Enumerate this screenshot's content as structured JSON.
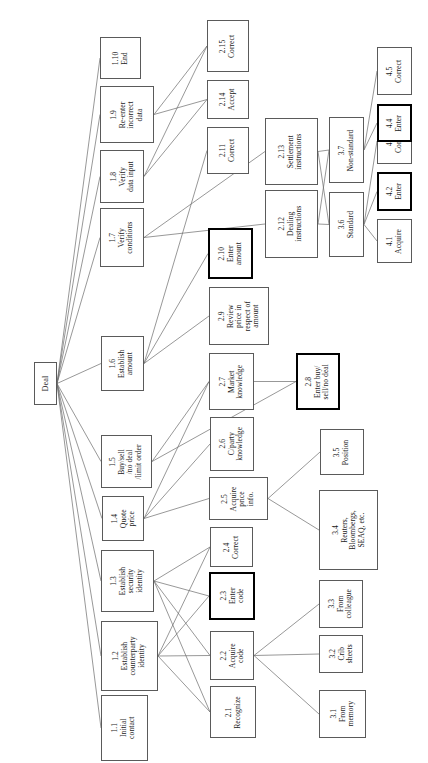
{
  "diagram": {
    "orientation": "rotated-90-ccw",
    "root": {
      "id": "deal",
      "num": "",
      "text": "Deal",
      "x": 34,
      "y": 362,
      "w": 23,
      "h": 43,
      "bold": false
    },
    "nodes": [
      {
        "id": "1.1",
        "num": "1.1",
        "text": "Initial\ncontact",
        "x": 101,
        "y": 695,
        "w": 47,
        "h": 66,
        "bold": false
      },
      {
        "id": "1.2",
        "num": "1.2",
        "text": "Establish\ncounterparty\nidentity",
        "x": 101,
        "y": 621,
        "w": 57,
        "h": 70,
        "bold": false
      },
      {
        "id": "1.3",
        "num": "1.3",
        "text": "Establish\nsecurity\nidentity",
        "x": 101,
        "y": 550,
        "w": 53,
        "h": 62,
        "bold": false
      },
      {
        "id": "1.4",
        "num": "1.4",
        "text": "Quote\nprice",
        "x": 102,
        "y": 496,
        "w": 42,
        "h": 45,
        "bold": false
      },
      {
        "id": "1.5",
        "num": "1.5",
        "text": "Buy/sell\n/no deal\n/limit order",
        "x": 101,
        "y": 435,
        "w": 51,
        "h": 53,
        "bold": false
      },
      {
        "id": "1.6",
        "num": "1.6",
        "text": "Establish\namount",
        "x": 101,
        "y": 336,
        "w": 43,
        "h": 55,
        "bold": false
      },
      {
        "id": "1.7",
        "num": "1.7",
        "text": "Verify\nconditions",
        "x": 100,
        "y": 208,
        "w": 44,
        "h": 59,
        "bold": false
      },
      {
        "id": "1.8",
        "num": "1.8",
        "text": "Verify\ndata input",
        "x": 100,
        "y": 150,
        "w": 44,
        "h": 53,
        "bold": false
      },
      {
        "id": "1.9",
        "num": "1.9",
        "text": "Re-enter\nincorrect\ndata",
        "x": 100,
        "y": 86,
        "w": 54,
        "h": 57,
        "bold": false
      },
      {
        "id": "1.10",
        "num": "1.10",
        "text": "End",
        "x": 100,
        "y": 37,
        "w": 41,
        "h": 42,
        "bold": false
      },
      {
        "id": "2.1",
        "num": "2.1",
        "text": "Recognize",
        "x": 210,
        "y": 686,
        "w": 46,
        "h": 52,
        "bold": false
      },
      {
        "id": "2.2",
        "num": "2.2",
        "text": "Acquire\ncode",
        "x": 210,
        "y": 631,
        "w": 44,
        "h": 49,
        "bold": false
      },
      {
        "id": "2.3",
        "num": "2.3",
        "text": "Enter\ncode",
        "x": 209,
        "y": 572,
        "w": 46,
        "h": 48,
        "bold": true
      },
      {
        "id": "2.4",
        "num": "2.4",
        "text": "Correct",
        "x": 210,
        "y": 527,
        "w": 43,
        "h": 40,
        "bold": false
      },
      {
        "id": "2.5",
        "num": "2.5",
        "text": "Acquire\nprice\ninfo.",
        "x": 209,
        "y": 477,
        "w": 59,
        "h": 43,
        "bold": false
      },
      {
        "id": "2.6",
        "num": "2.6",
        "text": "C/party\nknowledge",
        "x": 210,
        "y": 417,
        "w": 44,
        "h": 54,
        "bold": false
      },
      {
        "id": "2.7",
        "num": "2.7",
        "text": "Market\nknowledge",
        "x": 209,
        "y": 353,
        "w": 45,
        "h": 57,
        "bold": false
      },
      {
        "id": "2.8",
        "num": "2.8",
        "text": "Enter buy/\nsell/no deal",
        "x": 296,
        "y": 353,
        "w": 44,
        "h": 57,
        "bold": true
      },
      {
        "id": "2.9",
        "num": "2.9",
        "text": "Review\nprice in\nrespect of\namount",
        "x": 209,
        "y": 287,
        "w": 60,
        "h": 58,
        "bold": false
      },
      {
        "id": "2.10",
        "num": "2.10",
        "text": "Enter\namount",
        "x": 208,
        "y": 228,
        "w": 45,
        "h": 51,
        "bold": true
      },
      {
        "id": "2.11",
        "num": "2.11",
        "text": "Correct",
        "x": 207,
        "y": 127,
        "w": 42,
        "h": 47,
        "bold": false
      },
      {
        "id": "2.12",
        "num": "2.12",
        "text": "Dealing\ninstructions",
        "x": 265,
        "y": 190,
        "w": 53,
        "h": 68,
        "bold": false
      },
      {
        "id": "2.13",
        "num": "2.13",
        "text": "Settlement\ninstructions",
        "x": 265,
        "y": 118,
        "w": 53,
        "h": 67,
        "bold": false
      },
      {
        "id": "2.14",
        "num": "2.14",
        "text": "Accept",
        "x": 207,
        "y": 80,
        "w": 42,
        "h": 39,
        "bold": false
      },
      {
        "id": "2.15",
        "num": "2.15",
        "text": "Correct",
        "x": 207,
        "y": 20,
        "w": 42,
        "h": 52,
        "bold": false
      },
      {
        "id": "3.1",
        "num": "3.1",
        "text": "From\nmemory",
        "x": 319,
        "y": 690,
        "w": 47,
        "h": 48,
        "bold": false
      },
      {
        "id": "3.2",
        "num": "3.2",
        "text": "Crib\nsheets",
        "x": 319,
        "y": 635,
        "w": 44,
        "h": 38,
        "bold": false
      },
      {
        "id": "3.3",
        "num": "3.3",
        "text": "From\ncolleague",
        "x": 319,
        "y": 580,
        "w": 44,
        "h": 48,
        "bold": false
      },
      {
        "id": "3.4",
        "num": "3.4",
        "text": "Reuters,\nBloombergs,\nSEAQ, etc.",
        "x": 319,
        "y": 490,
        "w": 59,
        "h": 80,
        "bold": false
      },
      {
        "id": "3.5",
        "num": "3.5",
        "text": "Position",
        "x": 320,
        "y": 429,
        "w": 44,
        "h": 46,
        "bold": false
      },
      {
        "id": "3.6",
        "num": "3.6",
        "text": "Standard",
        "x": 329,
        "y": 192,
        "w": 35,
        "h": 65,
        "bold": false
      },
      {
        "id": "3.7",
        "num": "3.7",
        "text": "Non-standard",
        "x": 329,
        "y": 117,
        "w": 35,
        "h": 66,
        "bold": false
      },
      {
        "id": "4.1",
        "num": "4.1",
        "text": "Acquire",
        "x": 377,
        "y": 219,
        "w": 35,
        "h": 44,
        "bold": false
      },
      {
        "id": "4.2",
        "num": "4.2",
        "text": "Enter",
        "x": 377,
        "y": 172,
        "w": 35,
        "h": 39,
        "bold": true
      },
      {
        "id": "4.3",
        "num": "4.3",
        "text": "Correct",
        "x": 377,
        "y": 118,
        "w": 35,
        "h": 46,
        "bold": false
      },
      {
        "id": "4.4",
        "num": "4.4",
        "text": "Enter",
        "x": 377,
        "y": 104,
        "w": 35,
        "h": 38,
        "bold": true
      },
      {
        "id": "4.5",
        "num": "4.5",
        "text": "Correct",
        "x": 377,
        "y": 47,
        "w": 35,
        "h": 48,
        "bold": false
      }
    ],
    "edges": [
      {
        "from": "deal",
        "to": "1.1"
      },
      {
        "from": "deal",
        "to": "1.2"
      },
      {
        "from": "deal",
        "to": "1.3"
      },
      {
        "from": "deal",
        "to": "1.4"
      },
      {
        "from": "deal",
        "to": "1.5"
      },
      {
        "from": "deal",
        "to": "1.6"
      },
      {
        "from": "deal",
        "to": "1.7"
      },
      {
        "from": "deal",
        "to": "1.8"
      },
      {
        "from": "deal",
        "to": "1.9"
      },
      {
        "from": "deal",
        "to": "1.10"
      },
      {
        "from": "1.2",
        "to": "2.1"
      },
      {
        "from": "1.2",
        "to": "2.2"
      },
      {
        "from": "1.2",
        "to": "2.3"
      },
      {
        "from": "1.2",
        "to": "2.4"
      },
      {
        "from": "1.3",
        "to": "2.1"
      },
      {
        "from": "1.3",
        "to": "2.2"
      },
      {
        "from": "1.3",
        "to": "2.3"
      },
      {
        "from": "1.3",
        "to": "2.4"
      },
      {
        "from": "1.4",
        "to": "2.5"
      },
      {
        "from": "1.4",
        "to": "2.6"
      },
      {
        "from": "1.4",
        "to": "2.7"
      },
      {
        "from": "1.5",
        "to": "2.7"
      },
      {
        "from": "1.5",
        "to": "2.8"
      },
      {
        "from": "1.6",
        "to": "2.9"
      },
      {
        "from": "1.6",
        "to": "2.10"
      },
      {
        "from": "1.6",
        "to": "2.11"
      },
      {
        "from": "1.7",
        "to": "2.12"
      },
      {
        "from": "1.7",
        "to": "2.13"
      },
      {
        "from": "1.8",
        "to": "2.14"
      },
      {
        "from": "1.8",
        "to": "2.15"
      },
      {
        "from": "1.9",
        "to": "2.14"
      },
      {
        "from": "1.9",
        "to": "2.15"
      },
      {
        "from": "2.2",
        "to": "3.1"
      },
      {
        "from": "2.2",
        "to": "3.2"
      },
      {
        "from": "2.2",
        "to": "3.3"
      },
      {
        "from": "2.5",
        "to": "3.4"
      },
      {
        "from": "2.5",
        "to": "3.5"
      },
      {
        "from": "2.7",
        "to": "2.8"
      },
      {
        "from": "2.12",
        "to": "3.6"
      },
      {
        "from": "2.12",
        "to": "3.7"
      },
      {
        "from": "2.13",
        "to": "3.6"
      },
      {
        "from": "2.13",
        "to": "3.7"
      },
      {
        "from": "3.6",
        "to": "4.1"
      },
      {
        "from": "3.6",
        "to": "4.2"
      },
      {
        "from": "3.6",
        "to": "4.3"
      },
      {
        "from": "3.7",
        "to": "4.4"
      },
      {
        "from": "3.7",
        "to": "4.5"
      }
    ],
    "colors": {
      "node_border": "#5a5a5a",
      "node_border_bold": "#000000",
      "edge": "#6b6b6b",
      "background": "#ffffff",
      "text": "#1a1a1a"
    }
  }
}
